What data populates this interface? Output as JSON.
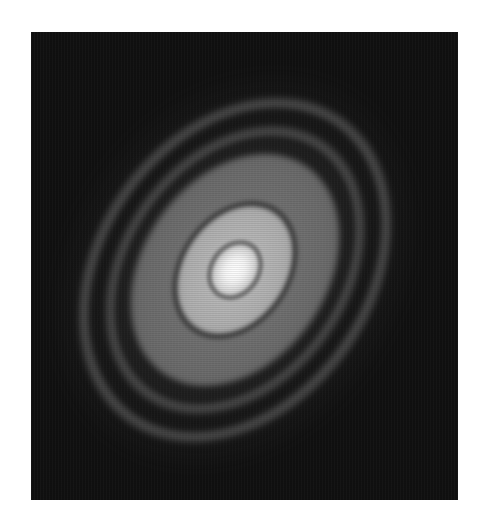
{
  "image": {
    "subject": "protoplanetary-disk-concentric-rings",
    "palette": {
      "background": "#ffffff",
      "sky": "#101010",
      "outer_ring": "#4a4a4a",
      "mid_band": "#6a6a6a",
      "inner_ring": "#a8a8a8",
      "core": "#ffffff"
    },
    "center": {
      "x": 204,
      "y": 238
    },
    "tilt_deg": 35
  }
}
